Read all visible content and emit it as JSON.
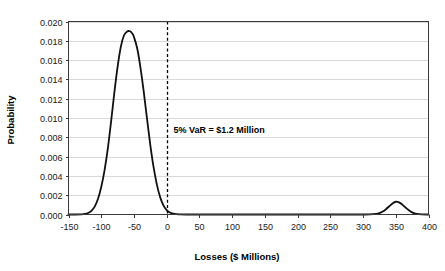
{
  "chart_data": {
    "type": "line",
    "title": "",
    "subtitle": "",
    "xlabel": "Losses ($ Millions)",
    "ylabel": "Probability",
    "xlim": [
      -150,
      400
    ],
    "ylim": [
      0,
      0.02
    ],
    "grid": true,
    "legend": null,
    "xticks": [
      -150,
      -100,
      -50,
      0,
      50,
      100,
      150,
      200,
      250,
      300,
      350,
      400
    ],
    "xtick_labels": [
      "-150",
      "-100",
      "-50",
      "0",
      "50",
      "100",
      "150",
      "200",
      "250",
      "300",
      "350",
      "400"
    ],
    "yticks": [
      0.0,
      0.002,
      0.004,
      0.006,
      0.008,
      0.01,
      0.012,
      0.014,
      0.016,
      0.018,
      0.02
    ],
    "ytick_labels": [
      "0.000",
      "0.002",
      "0.004",
      "0.006",
      "0.008",
      "0.010",
      "0.012",
      "0.014",
      "0.016",
      "0.018",
      "0.020"
    ],
    "series": [
      {
        "name": "Loss distribution",
        "color": "#111111",
        "x": [
          -150,
          -140,
          -130,
          -125,
          -120,
          -115,
          -110,
          -105,
          -100,
          -95,
          -90,
          -85,
          -80,
          -75,
          -70,
          -65,
          -60,
          -57,
          -55,
          -52,
          -50,
          -45,
          -40,
          -35,
          -30,
          -25,
          -20,
          -15,
          -10,
          -5,
          0,
          5,
          10,
          15,
          20,
          30,
          50,
          100,
          150,
          200,
          250,
          280,
          300,
          310,
          320,
          325,
          330,
          335,
          340,
          345,
          350,
          355,
          360,
          365,
          370,
          375,
          380,
          385,
          390,
          400
        ],
        "y": [
          0.0,
          0.0,
          2e-05,
          6e-05,
          0.00016,
          0.00038,
          0.00082,
          0.0016,
          0.00285,
          0.00455,
          0.0068,
          0.0096,
          0.0126,
          0.0153,
          0.0174,
          0.0186,
          0.01898,
          0.019,
          0.01895,
          0.0187,
          0.0184,
          0.0172,
          0.0152,
          0.0127,
          0.0099,
          0.0072,
          0.0049,
          0.0031,
          0.0018,
          0.00095,
          0.00046,
          0.0002,
          8e-05,
          3e-05,
          1e-05,
          0.0,
          0.0,
          0.0,
          0.0,
          0.0,
          0.0,
          0.0,
          0.0,
          1e-05,
          6e-05,
          0.00014,
          0.0003,
          0.00055,
          0.00085,
          0.00115,
          0.00132,
          0.00125,
          0.00102,
          0.00072,
          0.00044,
          0.00022,
          9e-05,
          3e-05,
          1e-05,
          0.0
        ]
      }
    ],
    "annotations": [
      {
        "name": "var-threshold",
        "text": "5% VaR = $1.2 Million",
        "x": 0,
        "y": 0.0088,
        "line_type": "vertical-dashed",
        "line_x": 0
      }
    ]
  }
}
